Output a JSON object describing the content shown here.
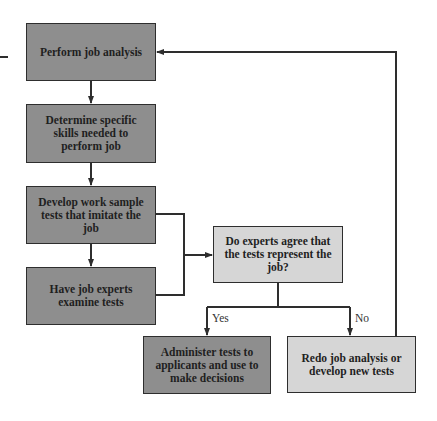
{
  "diagram": {
    "type": "flowchart",
    "nodes": {
      "perform_analysis": "Perform job analysis",
      "determine_skills": "Determine specific skills needed to perform job",
      "develop_tests": "Develop work sample tests that imitate the job",
      "experts_examine": "Have job experts examine tests",
      "decision": "Do experts agree that the tests represent the job?",
      "administer": "Administer tests to applicants and use to make decisions",
      "redo": "Redo job analysis or develop new tests"
    },
    "labels": {
      "yes": "Yes",
      "no": "No"
    },
    "edges": [
      {
        "from": "perform_analysis",
        "to": "determine_skills"
      },
      {
        "from": "determine_skills",
        "to": "develop_tests"
      },
      {
        "from": "develop_tests",
        "to": "experts_examine"
      },
      {
        "from": "develop_tests",
        "to": "decision"
      },
      {
        "from": "experts_examine",
        "to": "decision"
      },
      {
        "from": "decision",
        "to": "administer",
        "label": "Yes"
      },
      {
        "from": "decision",
        "to": "redo",
        "label": "No"
      },
      {
        "from": "redo",
        "to": "perform_analysis"
      }
    ],
    "colors": {
      "dark_box": "#8e8e8e",
      "light_box": "#d6d6d6",
      "line": "#2e2e2e"
    }
  }
}
